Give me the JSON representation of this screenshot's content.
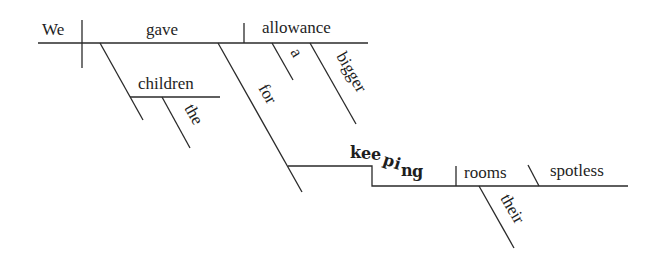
{
  "diagram": {
    "type": "Reed-Kellogg sentence diagram",
    "sentence": "We gave the children a bigger allowance for keeping their rooms spotless",
    "words": {
      "subject": "We",
      "verb": "gave",
      "direct_object": "allowance",
      "object_modifier_1": "a",
      "object_modifier_2": "bigger",
      "indirect_object": "children",
      "indirect_object_modifier": "the",
      "preposition": "for",
      "gerund": [
        "k",
        "e",
        "e",
        "p",
        "i",
        "n",
        "g"
      ],
      "gerund_object": "rooms",
      "gerund_object_modifier": "their",
      "object_complement": "spotless"
    }
  }
}
